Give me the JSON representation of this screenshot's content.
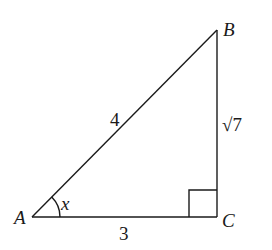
{
  "diagram": {
    "type": "right-triangle",
    "colors": {
      "stroke": "#1a1a1a",
      "background": "#ffffff"
    },
    "vertices": {
      "A": {
        "label": "A",
        "x": 32,
        "y": 217
      },
      "B": {
        "label": "B",
        "x": 217,
        "y": 30
      },
      "C": {
        "label": "C",
        "x": 217,
        "y": 217
      }
    },
    "sides": {
      "AB": {
        "label": "4"
      },
      "BC": {
        "label": "√7"
      },
      "AC": {
        "label": "3"
      }
    },
    "angle": {
      "vertex": "A",
      "label": "x"
    },
    "right_angle_at": "C"
  }
}
